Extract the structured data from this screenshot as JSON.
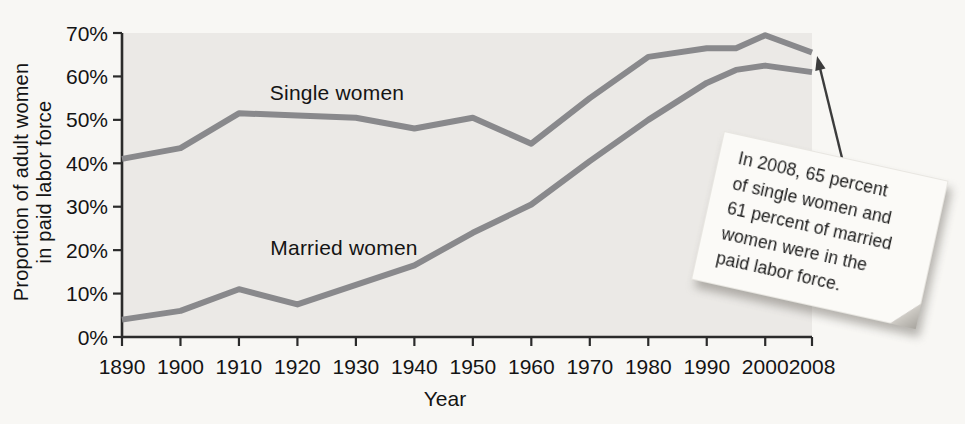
{
  "chart_data": {
    "type": "line",
    "title": "",
    "xlabel": "Year",
    "ylabel": "Proportion of adult women\nin paid labor force",
    "xlim": [
      1890,
      2008
    ],
    "ylim": [
      0,
      70
    ],
    "grid": false,
    "legend_position": "inline-labels-on-plot",
    "x": [
      1890,
      1900,
      1910,
      1920,
      1930,
      1940,
      1950,
      1960,
      1970,
      1980,
      1990,
      1995,
      2000,
      2008
    ],
    "x_ticks": [
      1890,
      1900,
      1910,
      1920,
      1930,
      1940,
      1950,
      1960,
      1970,
      1980,
      1990,
      2000,
      2008
    ],
    "x_tick_labels": [
      "1890",
      "1900",
      "1910",
      "1920",
      "1930",
      "1940",
      "1950",
      "1960",
      "1970",
      "1980",
      "1990",
      "2000",
      "2008"
    ],
    "y_ticks": [
      0,
      10,
      20,
      30,
      40,
      50,
      60,
      70
    ],
    "y_tick_labels": [
      "0%",
      "10%",
      "20%",
      "30%",
      "40%",
      "50%",
      "60%",
      "70%"
    ],
    "series": [
      {
        "name": "Single women",
        "values": [
          41,
          43.5,
          51.5,
          51,
          50.5,
          48,
          50.5,
          44.5,
          55,
          64.5,
          66.5,
          66.5,
          69.5,
          65.5
        ]
      },
      {
        "name": "Married women",
        "values": [
          4,
          6,
          11,
          7.5,
          12,
          16.5,
          24,
          30.5,
          40.5,
          50,
          58.5,
          61.5,
          62.5,
          61
        ]
      }
    ]
  },
  "annotation": {
    "text": "In 2008, 65 percent\nof single women and\n61 percent of married\nwomen were in the\npaid labor force."
  },
  "colors": {
    "page_bg": "#f8f7f4",
    "plot_bg": "#ebe9e6",
    "axis": "#2b2b2b",
    "line": "#89898c",
    "text": "#141414",
    "note_bg": "#fbfaf7",
    "arrow": "#3c3c3c"
  }
}
